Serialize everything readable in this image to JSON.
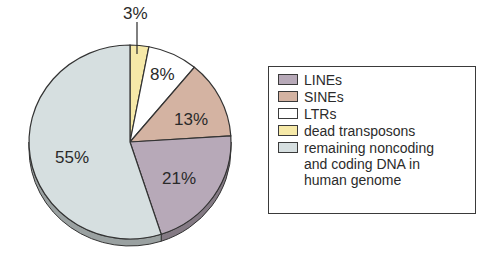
{
  "chart_data": {
    "type": "pie",
    "title": "",
    "slices": [
      {
        "label": "dead transposons",
        "value": 3,
        "display": "3%",
        "color": "#f6e9a8"
      },
      {
        "label": "LTRs",
        "value": 8,
        "display": "8%",
        "color": "#ffffff"
      },
      {
        "label": "SINEs",
        "value": 13,
        "display": "13%",
        "color": "#d4b3a2"
      },
      {
        "label": "LINEs",
        "value": 21,
        "display": "21%",
        "color": "#b7a9b8"
      },
      {
        "label": "remaining noncoding and coding DNA in human genome",
        "value": 55,
        "display": "55%",
        "color": "#d6dfe0"
      }
    ],
    "start_angle": "12 o'clock",
    "direction": "clockwise",
    "legend_position": "right",
    "style": "3D tilted pie with shaded edge"
  },
  "legend": {
    "items": [
      {
        "label": "LINEs",
        "color": "#b7a9b8"
      },
      {
        "label": "SINEs",
        "color": "#d4b3a2"
      },
      {
        "label": "LTRs",
        "color": "#ffffff"
      },
      {
        "label": "dead transposons",
        "color": "#f6e9a8"
      },
      {
        "label": "remaining noncoding\nand coding DNA in\nhuman genome",
        "color": "#d6dfe0"
      }
    ]
  },
  "labels": {
    "dead": "3%",
    "ltrs": "8%",
    "sines": "13%",
    "lines": "21%",
    "remaining": "55%"
  }
}
